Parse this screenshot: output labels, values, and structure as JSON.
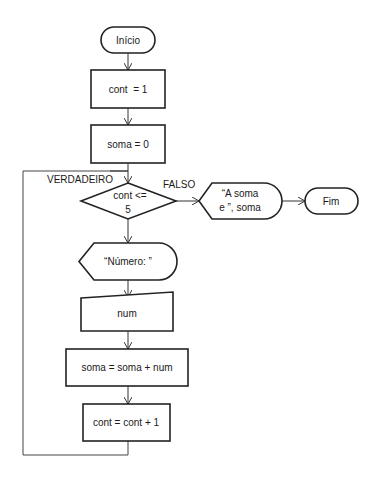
{
  "nodes": {
    "start": "Início",
    "init_cont": "cont  = 1",
    "init_soma": "soma = 0",
    "decision_line1": "cont <=",
    "decision_line2": "5",
    "output_sum_line1": "“A soma",
    "output_sum_line2": "e ”, soma",
    "end": "Fim",
    "prompt": "“Número: ”",
    "input": "num",
    "accumulate": "soma = soma + num",
    "increment": "cont = cont + 1"
  },
  "edges": {
    "true_label": "VERDADEIRO",
    "false_label": "FALSO"
  },
  "colors": {
    "stroke": "#222222",
    "background": "#ffffff"
  }
}
